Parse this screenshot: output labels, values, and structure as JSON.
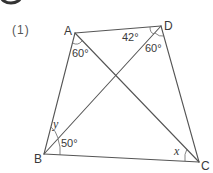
{
  "problem": {
    "number_label": "(1)",
    "badge_color": "#333333"
  },
  "figure": {
    "stroke_color": "#555555",
    "vertices": {
      "A": {
        "label": "A",
        "x": 75,
        "y": 33
      },
      "D": {
        "label": "D",
        "x": 161,
        "y": 26
      },
      "B": {
        "label": "B",
        "x": 44,
        "y": 154
      },
      "C": {
        "label": "C",
        "x": 199,
        "y": 162
      }
    },
    "segments": [
      "AB",
      "AD",
      "DC",
      "BC",
      "AC",
      "BD"
    ],
    "angles": [
      {
        "vertex": "A",
        "between": [
          "AB",
          "AC"
        ],
        "label": "60°"
      },
      {
        "vertex": "D",
        "between": [
          "DA",
          "DB"
        ],
        "label": "42°"
      },
      {
        "vertex": "D",
        "between": [
          "DB",
          "DC"
        ],
        "label": "60°"
      },
      {
        "vertex": "B",
        "between": [
          "BA",
          "BD"
        ],
        "label": "y"
      },
      {
        "vertex": "B",
        "between": [
          "BD",
          "BC"
        ],
        "label": "50°"
      },
      {
        "vertex": "C",
        "between": [
          "CA",
          "CB"
        ],
        "label": "x"
      }
    ]
  },
  "labels": {
    "A": "A",
    "B": "B",
    "C": "C",
    "D": "D",
    "angle_A": "60°",
    "angle_D_left": "42°",
    "angle_D_right": "60°",
    "angle_B_upper": "y",
    "angle_B_lower": "50°",
    "angle_C": "x"
  }
}
